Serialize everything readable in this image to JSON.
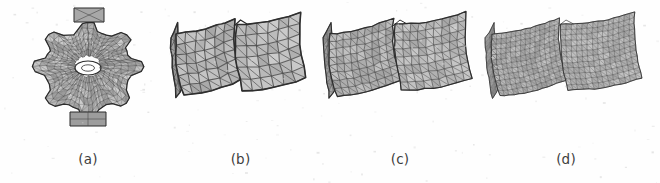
{
  "figure": {
    "background_color": "#fefefe",
    "mesh_fill_color": "#b9b9b9",
    "mesh_line_color": "#4a4a4a",
    "caption_color": "#3d3d3d",
    "subfigures": [
      {
        "label": "(a)",
        "name": "gear-disc-mesh",
        "description": "dense triangulated gear-shaped disc with central hole and radial lobes",
        "density": "fine",
        "grid_u": 13,
        "grid_v": 13
      },
      {
        "label": "(b)",
        "name": "coarse-slab-mesh",
        "description": "two curved slabs with coarse quad grid split into triangles",
        "density": "coarse",
        "grid_u": 6,
        "grid_v": 6
      },
      {
        "label": "(c)",
        "name": "medium-slab-mesh",
        "description": "two curved slabs with medium density triangulated grid",
        "density": "medium",
        "grid_u": 9,
        "grid_v": 8
      },
      {
        "label": "(d)",
        "name": "fine-slab-mesh",
        "description": "two curved slabs with fine irregular triangulation",
        "density": "very-fine",
        "grid_u": 14,
        "grid_v": 12
      }
    ]
  }
}
